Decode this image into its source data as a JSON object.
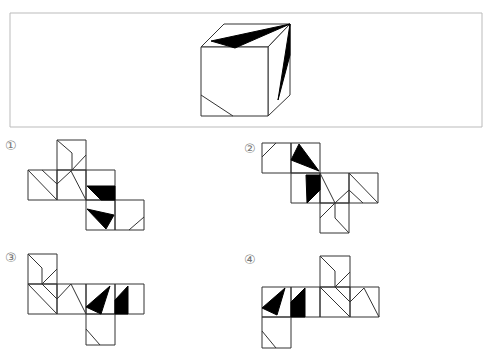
{
  "question": {
    "frame": {
      "x": 10,
      "y": 13,
      "width": 472,
      "height": 114,
      "border_color": "#bbbbbb"
    },
    "cube": {
      "description": "Cube with black triangle on top face, black sliver triangle on right face, diagonal line on lower-left of front face"
    }
  },
  "options": [
    {
      "label": "①",
      "name": "option-1"
    },
    {
      "label": "②",
      "name": "option-2"
    },
    {
      "label": "③",
      "name": "option-3"
    },
    {
      "label": "④",
      "name": "option-4"
    }
  ],
  "colors": {
    "stroke": "#333333",
    "fill": "#000000",
    "background": "#ffffff"
  }
}
